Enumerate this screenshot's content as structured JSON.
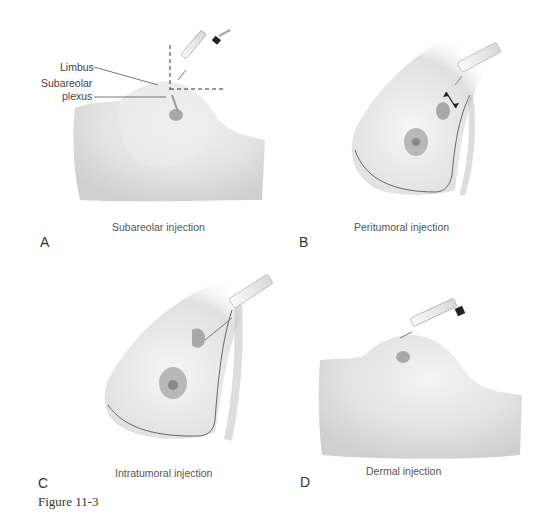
{
  "figure": {
    "number_label": "Figure 11-3",
    "panels": [
      {
        "letter": "A",
        "caption": "Subareolar injection",
        "annotations": [
          "Limbus",
          "Subareolar",
          "plexus"
        ]
      },
      {
        "letter": "B",
        "caption": "Peritumoral injection"
      },
      {
        "letter": "C",
        "caption": "Intratumoral injection"
      },
      {
        "letter": "D",
        "caption": "Dermal injection"
      }
    ]
  },
  "colors": {
    "skin": "#e6e6e6",
    "shadow": "#c8c8c8",
    "tumor": "#a8a8a8",
    "areola": "#b0b0b0",
    "outline": "#666666"
  }
}
